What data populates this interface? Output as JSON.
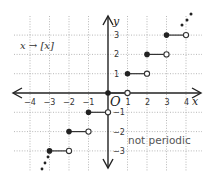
{
  "chart_data": {
    "type": "line",
    "title": "",
    "function_label": "x → [x]",
    "annotation": "not periodic",
    "xlabel": "x",
    "ylabel": "y",
    "origin_label": "O",
    "xlim": [
      -4.9,
      4.9
    ],
    "ylim": [
      -3.9,
      4.0
    ],
    "grid": true,
    "x_ticks": [
      -4,
      -3,
      -2,
      -1,
      1,
      2,
      3,
      4
    ],
    "x_tick_labels": [
      "−4",
      "−3",
      "−2",
      "−1",
      "1",
      "2",
      "3",
      "4"
    ],
    "y_ticks": [
      3,
      2,
      1,
      -1,
      -2,
      -3
    ],
    "y_tick_labels": [
      "3",
      "2",
      "1",
      "−1",
      "−2",
      "−3"
    ],
    "series": [
      {
        "name": "floor step",
        "segments": [
          {
            "y": 3,
            "x_start": 3,
            "x_end": 4,
            "start": "closed",
            "end": "open"
          },
          {
            "y": 2,
            "x_start": 2,
            "x_end": 3,
            "start": "closed",
            "end": "open"
          },
          {
            "y": 1,
            "x_start": 1,
            "x_end": 2,
            "start": "closed",
            "end": "open"
          },
          {
            "y": 0,
            "x_start": 0,
            "x_end": 1,
            "start": "closed",
            "end": "open"
          },
          {
            "y": -1,
            "x_start": -1,
            "x_end": 0,
            "start": "closed",
            "end": "open"
          },
          {
            "y": -2,
            "x_start": -2,
            "x_end": -1,
            "start": "closed",
            "end": "open"
          },
          {
            "y": -3,
            "x_start": -3,
            "x_end": -2,
            "start": "closed",
            "end": "open"
          }
        ]
      }
    ],
    "continuation": [
      "upper-right ellipsis",
      "lower-left ellipsis"
    ]
  }
}
